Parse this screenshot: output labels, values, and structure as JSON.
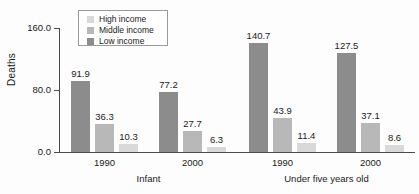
{
  "chart_data": {
    "type": "bar",
    "title": "",
    "subtitle": "",
    "xlabel": "",
    "ylabel": "Deaths",
    "ylim": [
      0,
      160
    ],
    "yticks": [
      "0.0",
      "80.0",
      "160.0"
    ],
    "ytick_values": [
      0,
      80,
      160
    ],
    "grid": false,
    "legend_position": "top-left",
    "categories": [
      "1990",
      "2000",
      "1990",
      "2000"
    ],
    "group_labels": [
      "Infant",
      "Under five years old"
    ],
    "groups": [
      {
        "group": "Infant",
        "year": "1990",
        "bars": [
          {
            "series": "Low income",
            "value": 140.7,
            "label": "91.9",
            "shown": 91.9
          },
          {
            "series": "Middle income",
            "value": 36.3,
            "label": "36.3",
            "shown": 36.3
          },
          {
            "series": "High income",
            "value": 10.3,
            "label": "10.3",
            "shown": 10.3
          }
        ]
      }
    ],
    "series": [
      {
        "name": "High income",
        "color": "#d9d9d9",
        "values": [
          10.3,
          6.3,
          11.4,
          8.6
        ]
      },
      {
        "name": "Middle income",
        "color": "#b8b8b8",
        "values": [
          36.3,
          27.7,
          43.9,
          37.1
        ]
      },
      {
        "name": "Low income",
        "color": "#8c8c8c",
        "values": [
          91.9,
          77.2,
          140.7,
          127.5
        ]
      }
    ],
    "bar_groups": [
      {
        "tick_label": "1990",
        "group_label": "Infant",
        "bars": [
          {
            "series": "Low income",
            "value": 91.9,
            "label": "91.9",
            "color": "#8c8c8c"
          },
          {
            "series": "Middle income",
            "value": 36.3,
            "label": "36.3",
            "color": "#b8b8b8"
          },
          {
            "series": "High income",
            "value": 10.3,
            "label": "10.3",
            "color": "#d9d9d9"
          }
        ]
      },
      {
        "tick_label": "2000",
        "group_label": "Infant",
        "bars": [
          {
            "series": "Low income",
            "value": 77.2,
            "label": "77.2",
            "color": "#8c8c8c"
          },
          {
            "series": "Middle income",
            "value": 27.7,
            "label": "27.7",
            "color": "#b8b8b8"
          },
          {
            "series": "High income",
            "value": 6.3,
            "label": "6.3",
            "color": "#d9d9d9"
          }
        ]
      },
      {
        "tick_label": "1990",
        "group_label": "Under five years old",
        "bars": [
          {
            "series": "Low income",
            "value": 140.7,
            "label": "140.7",
            "color": "#8c8c8c"
          },
          {
            "series": "Middle income",
            "value": 43.9,
            "label": "43.9",
            "color": "#b8b8b8"
          },
          {
            "series": "High income",
            "value": 11.4,
            "label": "11.4",
            "color": "#d9d9d9"
          }
        ]
      },
      {
        "tick_label": "2000",
        "group_label": "Under five years old",
        "bars": [
          {
            "series": "Low income",
            "value": 127.5,
            "label": "127.5",
            "color": "#8c8c8c"
          },
          {
            "series": "Middle income",
            "value": 37.1,
            "label": "37.1",
            "color": "#b8b8b8"
          },
          {
            "series": "High income",
            "value": 8.6,
            "label": "8.6",
            "color": "#d9d9d9"
          }
        ]
      }
    ],
    "legend": [
      {
        "label": "High income",
        "color": "#d9d9d9"
      },
      {
        "label": "Middle income",
        "color": "#b8b8b8"
      },
      {
        "label": "Low income",
        "color": "#8c8c8c"
      }
    ]
  },
  "colors": {
    "axis": "#4a4a4a",
    "text": "#1a1a1a",
    "background": "#fdfdfd",
    "legend_border": "#9a9a9a",
    "high_income": "#d9d9d9",
    "middle_income": "#b8b8b8",
    "low_income": "#8c8c8c"
  }
}
